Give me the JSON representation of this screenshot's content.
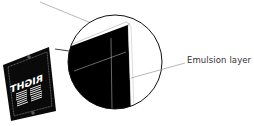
{
  "diagram": {
    "type": "film-sheet-emulsion-callout",
    "film_text": "RIGHT",
    "film_text_mirrored": true,
    "labels": {
      "emulsion": "Emulsion layer"
    },
    "colors": {
      "film": "#000000",
      "leader_line": "#999999",
      "outline": "#111111",
      "background": "#ffffff"
    }
  }
}
